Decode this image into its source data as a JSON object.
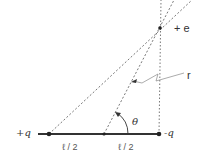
{
  "diagram": {
    "labels": {
      "plus_charge": "+q",
      "minus_charge": "-q",
      "test_charge": "+ e",
      "distance": "r",
      "angle": "θ",
      "half_length_left": "ℓ / 2",
      "half_length_right": "ℓ / 2"
    },
    "colors": {
      "line": "#333333",
      "dashed": "#555555",
      "text": "#333333"
    }
  }
}
